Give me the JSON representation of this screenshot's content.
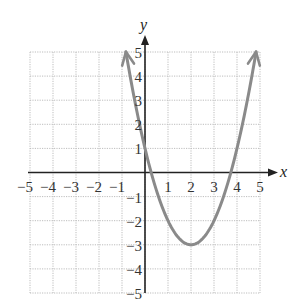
{
  "chart_data": {
    "type": "line",
    "title": "",
    "xlabel": "x",
    "ylabel": "y",
    "xlim": [
      -5,
      5
    ],
    "ylim": [
      -5,
      5
    ],
    "grid": true,
    "grid_style": "dotted",
    "x_ticks": [
      -5,
      -4,
      -3,
      -2,
      -1,
      1,
      2,
      3,
      4,
      5
    ],
    "y_ticks": [
      5,
      4,
      3,
      2,
      1,
      -1,
      -2,
      -3,
      -4,
      -5
    ],
    "x_tick_labels": [
      "−5",
      "−4",
      "−3",
      "−2",
      "−1",
      "1",
      "2",
      "3",
      "4",
      "5"
    ],
    "y_tick_labels": [
      "5",
      "4",
      "3",
      "2",
      "1",
      "−1",
      "−2",
      "−3",
      "−4",
      "−5"
    ],
    "series": [
      {
        "name": "parabola",
        "equation": "y = x^2 - 4x + 1",
        "vertex": [
          2,
          -3
        ],
        "y_intercept": 1,
        "x_intercepts": [
          0.27,
          3.73
        ],
        "x_range": [
          -0.83,
          4.83
        ],
        "arrows_at_ends": true,
        "color": "#8a8a8a",
        "points": [
          [
            -0.83,
            5
          ],
          [
            0,
            1
          ],
          [
            1,
            -2
          ],
          [
            2,
            -3
          ],
          [
            3,
            -2
          ],
          [
            4,
            1
          ],
          [
            4.83,
            5
          ]
        ]
      }
    ],
    "colors": {
      "axis": "#222222",
      "grid": "#bdbdbd",
      "curve": "#8a8a8a"
    }
  }
}
